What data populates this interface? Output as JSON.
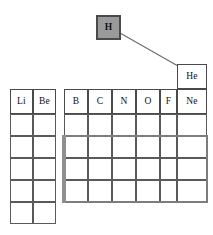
{
  "diagram": {
    "colors": {
      "grid_line": "#4a4a4a",
      "highlight_fill": "#9a9a9a",
      "divider_bar": "#8f8f8f",
      "connector_line": "#6b6b6b",
      "background": "#ffffff"
    },
    "callout": {
      "label": "H",
      "name": "hydrogen-callout-box"
    },
    "connector": {
      "name": "callout-connector-line",
      "from_x": 120,
      "from_y": 33,
      "to_x": 178,
      "to_y": 66
    },
    "helium": {
      "label": "He"
    },
    "s_block": {
      "labels": [
        "Li",
        "Be"
      ],
      "columns": 2,
      "rows": 6,
      "blank_rows": 5
    },
    "p_block": {
      "labels": [
        "B",
        "C",
        "N",
        "O",
        "F",
        "Ne"
      ],
      "columns": 6,
      "rows": 5,
      "blank_rows": 4
    }
  }
}
